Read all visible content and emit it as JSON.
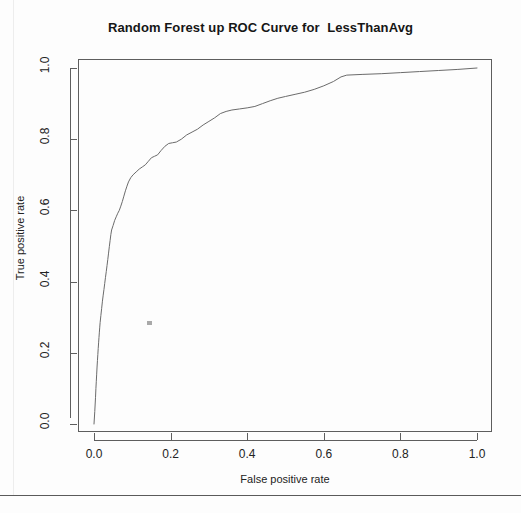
{
  "chart_data": {
    "type": "line",
    "title": "Random Forest up ROC Curve for  LessThanAvg",
    "xlabel": "False positive rate",
    "ylabel": "True positive rate",
    "xlim": [
      0.0,
      1.0
    ],
    "ylim": [
      0.0,
      1.0
    ],
    "grid": false,
    "legend": null,
    "xticks": [
      "0.0",
      "0.2",
      "0.4",
      "0.6",
      "0.8",
      "1.0"
    ],
    "xtick_values": [
      0.0,
      0.2,
      0.4,
      0.6,
      0.8,
      1.0
    ],
    "yticks": [
      "0.0",
      "0.2",
      "0.4",
      "0.6",
      "0.8",
      "1.0"
    ],
    "ytick_values": [
      0.0,
      0.2,
      0.4,
      0.6,
      0.8,
      1.0
    ],
    "series": [
      {
        "name": "ROC curve",
        "color": "#6b6b6b",
        "x": [
          0.0,
          0.002,
          0.004,
          0.005,
          0.006,
          0.007,
          0.008,
          0.009,
          0.01,
          0.011,
          0.012,
          0.013,
          0.014,
          0.015,
          0.016,
          0.018,
          0.02,
          0.022,
          0.024,
          0.026,
          0.028,
          0.03,
          0.032,
          0.034,
          0.036,
          0.038,
          0.04,
          0.042,
          0.044,
          0.046,
          0.05,
          0.054,
          0.058,
          0.062,
          0.066,
          0.07,
          0.074,
          0.078,
          0.082,
          0.086,
          0.09,
          0.096,
          0.102,
          0.11,
          0.118,
          0.126,
          0.134,
          0.142,
          0.15,
          0.158,
          0.166,
          0.175,
          0.185,
          0.195,
          0.205,
          0.215,
          0.228,
          0.242,
          0.256,
          0.27,
          0.285,
          0.3,
          0.315,
          0.33,
          0.345,
          0.36,
          0.38,
          0.4,
          0.42,
          0.44,
          0.46,
          0.48,
          0.5,
          0.525,
          0.55,
          0.575,
          0.6,
          0.625,
          0.645,
          0.66,
          0.7,
          0.75,
          0.8,
          0.85,
          0.9,
          0.95,
          1.0
        ],
        "y": [
          0.0,
          0.035,
          0.075,
          0.1,
          0.12,
          0.14,
          0.16,
          0.178,
          0.195,
          0.212,
          0.228,
          0.243,
          0.258,
          0.272,
          0.285,
          0.305,
          0.325,
          0.345,
          0.362,
          0.378,
          0.395,
          0.412,
          0.428,
          0.445,
          0.462,
          0.48,
          0.498,
          0.515,
          0.532,
          0.545,
          0.558,
          0.572,
          0.582,
          0.592,
          0.6,
          0.612,
          0.625,
          0.64,
          0.655,
          0.668,
          0.68,
          0.692,
          0.7,
          0.708,
          0.716,
          0.722,
          0.728,
          0.738,
          0.748,
          0.752,
          0.756,
          0.768,
          0.78,
          0.788,
          0.79,
          0.792,
          0.8,
          0.812,
          0.82,
          0.828,
          0.84,
          0.85,
          0.86,
          0.872,
          0.878,
          0.882,
          0.885,
          0.888,
          0.892,
          0.9,
          0.908,
          0.915,
          0.92,
          0.926,
          0.932,
          0.94,
          0.95,
          0.962,
          0.975,
          0.98,
          0.982,
          0.984,
          0.987,
          0.99,
          0.993,
          0.996,
          1.0
        ]
      }
    ]
  }
}
